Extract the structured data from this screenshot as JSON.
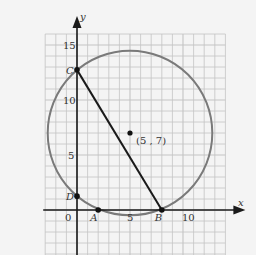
{
  "diagram": {
    "axes": {
      "x_label": "x",
      "y_label": "y",
      "origin_label": "0"
    },
    "x_ticks": [
      {
        "value": 5,
        "label": "5"
      },
      {
        "value": 10,
        "label": "10"
      }
    ],
    "y_ticks": [
      {
        "value": 5,
        "label": "5"
      },
      {
        "value": 10,
        "label": "10"
      },
      {
        "value": 15,
        "label": "15"
      }
    ],
    "grid": {
      "x_min": -3,
      "x_max": 14,
      "y_min": -5,
      "y_max": 16
    },
    "circle": {
      "center": [
        5,
        7
      ],
      "center_label": "(5 , 7)",
      "radius": 7.62
    },
    "points": [
      {
        "name": "A",
        "x": 2,
        "y": 0
      },
      {
        "name": "B",
        "x": 8,
        "y": 0
      },
      {
        "name": "C",
        "x": 0,
        "y": 12.74
      },
      {
        "name": "D",
        "x": 0,
        "y": 1.26
      }
    ],
    "segments": [
      [
        "C",
        "B"
      ]
    ],
    "colors": {
      "grid": "#c4c4c4",
      "circle": "#7a7a7a",
      "axis": "#1a1a1a",
      "segment": "#1a1a1a"
    }
  }
}
